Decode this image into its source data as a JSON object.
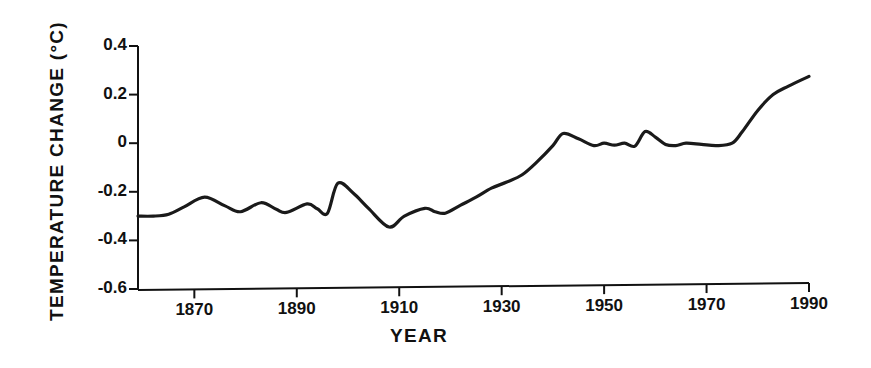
{
  "chart_data": {
    "type": "line",
    "title": "",
    "xlabel": "YEAR",
    "ylabel": "TEMPERATURE CHANGE (°C)",
    "xlim": [
      1859,
      1990
    ],
    "ylim": [
      -0.6,
      0.4
    ],
    "grid": false,
    "legend": null,
    "xticks": [
      1870,
      1890,
      1910,
      1930,
      1950,
      1970,
      1990
    ],
    "xtick_labels": [
      "1870",
      "1890",
      "1910",
      "1930",
      "1950",
      "1970",
      "1990"
    ],
    "yticks": [
      0.4,
      0.2,
      0,
      -0.2,
      -0.4,
      -0.6
    ],
    "ytick_labels": [
      "0.4",
      "0.2",
      "0",
      "-0.2",
      "-0.4",
      "-0.6"
    ],
    "series": [
      {
        "name": "Global temperature change",
        "color": "#1a1a1a",
        "linewidth": 3.2,
        "x": [
          1859,
          1862,
          1865,
          1868,
          1872,
          1876,
          1879,
          1883,
          1886,
          1888,
          1892,
          1894,
          1896,
          1898,
          1901,
          1904,
          1908,
          1911,
          1915,
          1917,
          1919,
          1922,
          1925,
          1928,
          1931,
          1934,
          1937,
          1940,
          1942,
          1945,
          1948,
          1950,
          1952,
          1954,
          1956,
          1958,
          1960,
          1962,
          1964,
          1966,
          1969,
          1972,
          1975,
          1977,
          1980,
          1983,
          1986,
          1990
        ],
        "y": [
          -0.3,
          -0.3,
          -0.292,
          -0.262,
          -0.222,
          -0.258,
          -0.282,
          -0.245,
          -0.272,
          -0.285,
          -0.25,
          -0.27,
          -0.288,
          -0.165,
          -0.205,
          -0.268,
          -0.345,
          -0.3,
          -0.268,
          -0.282,
          -0.288,
          -0.255,
          -0.222,
          -0.185,
          -0.16,
          -0.13,
          -0.075,
          -0.01,
          0.04,
          0.018,
          -0.01,
          0.0,
          -0.008,
          0.0,
          -0.012,
          0.048,
          0.025,
          -0.005,
          -0.01,
          0.0,
          -0.005,
          -0.01,
          0.0,
          0.048,
          0.135,
          0.2,
          0.235,
          0.275
        ]
      }
    ]
  },
  "axes": {
    "axis_color": "#111111",
    "tick_length": 9,
    "axis_linewidth": 2
  }
}
